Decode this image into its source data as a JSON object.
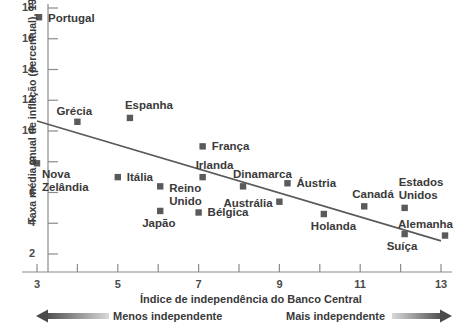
{
  "chart_data": {
    "type": "scatter",
    "title": "",
    "xlabel": "Índice de independência do Banco Central",
    "ylabel": "Taxa média anual de inflação (percentual), 1960-1990",
    "xlim": [
      3,
      13
    ],
    "ylim": [
      2,
      18
    ],
    "xticks": [
      3,
      4,
      5,
      6,
      7,
      8,
      9,
      10,
      11,
      12,
      13
    ],
    "xtick_labels": [
      "3",
      "",
      "5",
      "",
      "7",
      "",
      "9",
      "",
      "11",
      "",
      "13"
    ],
    "yticks": [
      2,
      4,
      6,
      8,
      10,
      12,
      14,
      16,
      18
    ],
    "ytick_labels": [
      "2",
      "4",
      "6",
      "8",
      "10",
      "12",
      "14",
      "16",
      "18"
    ],
    "grid": false,
    "legend": "none",
    "marker_color": "#5a5a5a",
    "line_color": "#5a5a5a",
    "trendline": {
      "x0": 3.0,
      "y0": 10.65,
      "x1": 13.0,
      "y1": 2.85
    },
    "points": [
      {
        "label": "Portugal",
        "x": 3.05,
        "y": 17.4,
        "label_dx": 9,
        "label_dy": -5,
        "align": "left"
      },
      {
        "label": "Nova\nZelândia",
        "x": 3.0,
        "y": 7.9,
        "label_dx": 5,
        "label_dy": 5,
        "align": "left"
      },
      {
        "label": "Grécia",
        "x": 4.0,
        "y": 10.6,
        "label_dx": -21,
        "label_dy": -17,
        "align": "left"
      },
      {
        "label": "Espanha",
        "x": 5.3,
        "y": 10.85,
        "label_dx": -5,
        "label_dy": -19,
        "align": "left"
      },
      {
        "label": "Itália",
        "x": 5.0,
        "y": 7.0,
        "label_dx": 9,
        "label_dy": -6,
        "align": "left"
      },
      {
        "label": "Reino\nUnido",
        "x": 6.05,
        "y": 6.4,
        "label_dx": 9,
        "label_dy": -4,
        "align": "left"
      },
      {
        "label": "Japão",
        "x": 6.05,
        "y": 4.8,
        "label_dx": -18,
        "label_dy": 6,
        "align": "left"
      },
      {
        "label": "França",
        "x": 7.1,
        "y": 9.0,
        "label_dx": 9,
        "label_dy": -6,
        "align": "left"
      },
      {
        "label": "Irlanda",
        "x": 7.1,
        "y": 7.0,
        "label_dx": -7,
        "label_dy": -18,
        "align": "left"
      },
      {
        "label": "Bélgica",
        "x": 7.0,
        "y": 4.7,
        "label_dx": 9,
        "label_dy": -6,
        "align": "left"
      },
      {
        "label": "Dinamarca",
        "x": 8.1,
        "y": 6.4,
        "label_dx": -10,
        "label_dy": -18,
        "align": "left"
      },
      {
        "label": "Austrália",
        "x": 9.0,
        "y": 5.4,
        "label_dx": -56,
        "label_dy": -5,
        "align": "left"
      },
      {
        "label": "Áustria",
        "x": 9.2,
        "y": 6.6,
        "label_dx": 9,
        "label_dy": -6,
        "align": "left"
      },
      {
        "label": "Holanda",
        "x": 10.1,
        "y": 4.6,
        "label_dx": -13,
        "label_dy": 6,
        "align": "left"
      },
      {
        "label": "Canadá",
        "x": 11.1,
        "y": 5.1,
        "label_dx": -12,
        "label_dy": -18,
        "align": "left"
      },
      {
        "label": "Estados\nUnidos",
        "x": 12.1,
        "y": 5.0,
        "label_dx": -6,
        "label_dy": -32,
        "align": "left"
      },
      {
        "label": "Suíça",
        "x": 12.1,
        "y": 3.3,
        "label_dx": -18,
        "label_dy": 6,
        "align": "left"
      },
      {
        "label": "Alemanha",
        "x": 13.1,
        "y": 3.2,
        "label_dx": -47,
        "label_dy": -18,
        "align": "left"
      }
    ],
    "annotations": {
      "left_arrow_label": "Menos independente",
      "right_arrow_label": "Mais independente"
    }
  },
  "axes": {
    "x_title": "Índice de independência do Banco Central",
    "y_title": "Taxa média anual de inflação (percentual), 1960-1990"
  },
  "footer": {
    "less_independent": "Menos independente",
    "more_independent": "Mais independente"
  }
}
